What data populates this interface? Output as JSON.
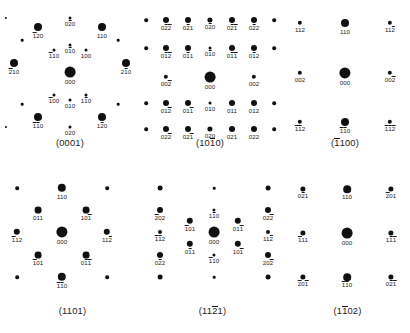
{
  "figure": {
    "title": "",
    "spot_color": "#111111",
    "background": "#ffffff",
    "panel_count": 6
  },
  "panels": [
    {
      "id": "panel-0001",
      "caption": "(0001)",
      "caption_plain": "0001",
      "box": {
        "x": 0,
        "y": 0,
        "w": 140,
        "h": 165
      },
      "spots": [
        {
          "x": 70,
          "y": 72,
          "r": 5.4,
          "label": "000",
          "bars": []
        },
        {
          "x": 38,
          "y": 27,
          "r": 4.0,
          "label": "120",
          "bars": [
            0
          ]
        },
        {
          "x": 102,
          "y": 27,
          "r": 4.0,
          "label": "110",
          "bars": []
        },
        {
          "x": 14,
          "y": 63,
          "r": 4.0,
          "label": "210",
          "bars": [
            0
          ]
        },
        {
          "x": 126,
          "y": 63,
          "r": 4.0,
          "label": "210",
          "bars": [
            1
          ]
        },
        {
          "x": 38,
          "y": 117,
          "r": 4.0,
          "label": "110",
          "bars": [
            0,
            1
          ]
        },
        {
          "x": 102,
          "y": 117,
          "r": 4.0,
          "label": "120",
          "bars": [
            1
          ]
        },
        {
          "x": 70,
          "y": 18,
          "r": 1.5,
          "label": "020",
          "bars": [
            1
          ]
        },
        {
          "x": 70,
          "y": 45,
          "r": 1.5,
          "label": "010",
          "bars": [
            1
          ]
        },
        {
          "x": 54,
          "y": 50,
          "r": 1.5,
          "label": "110",
          "bars": [
            0
          ]
        },
        {
          "x": 86,
          "y": 50,
          "r": 1.5,
          "label": "100",
          "bars": []
        },
        {
          "x": 54,
          "y": 95,
          "r": 1.5,
          "label": "100",
          "bars": [
            0
          ]
        },
        {
          "x": 86,
          "y": 95,
          "r": 1.5,
          "label": "110",
          "bars": [
            1
          ]
        },
        {
          "x": 70,
          "y": 100,
          "r": 1.5,
          "label": "010",
          "bars": []
        },
        {
          "x": 70,
          "y": 127,
          "r": 1.5,
          "label": "020",
          "bars": []
        },
        {
          "x": 22,
          "y": 40,
          "r": 1.3,
          "label": "",
          "bars": []
        },
        {
          "x": 118,
          "y": 40,
          "r": 1.3,
          "label": "",
          "bars": []
        },
        {
          "x": 22,
          "y": 104,
          "r": 1.3,
          "label": "",
          "bars": []
        },
        {
          "x": 118,
          "y": 104,
          "r": 1.3,
          "label": "",
          "bars": []
        },
        {
          "x": 6,
          "y": 18,
          "r": 1.1,
          "label": "",
          "bars": []
        },
        {
          "x": 6,
          "y": 127,
          "r": 1.1,
          "label": "",
          "bars": []
        }
      ]
    },
    {
      "id": "panel-1010",
      "caption": "(1010)",
      "caption_plain": "1010",
      "caption_bar_index": 2,
      "box": {
        "x": 140,
        "y": 0,
        "w": 140,
        "h": 165
      },
      "spots": [
        {
          "x": 70,
          "y": 77,
          "r": 5.4,
          "label": "000",
          "bars": []
        },
        {
          "x": 26,
          "y": 77,
          "r": 2.2,
          "label": "002",
          "bars": [
            2
          ]
        },
        {
          "x": 114,
          "y": 77,
          "r": 2.2,
          "label": "002",
          "bars": []
        },
        {
          "x": 26,
          "y": 48,
          "r": 3.0,
          "label": "012",
          "bars": [
            1,
            2
          ]
        },
        {
          "x": 48,
          "y": 48,
          "r": 3.0,
          "label": "011",
          "bars": [
            1
          ]
        },
        {
          "x": 70,
          "y": 48,
          "r": 1.5,
          "label": "010",
          "bars": [
            1
          ]
        },
        {
          "x": 92,
          "y": 48,
          "r": 3.0,
          "label": "011",
          "bars": [
            1,
            2
          ]
        },
        {
          "x": 114,
          "y": 48,
          "r": 3.0,
          "label": "012",
          "bars": [
            1
          ]
        },
        {
          "x": 6,
          "y": 48,
          "r": 1.8,
          "label": "",
          "bars": []
        },
        {
          "x": 134,
          "y": 48,
          "r": 1.8,
          "label": "",
          "bars": []
        },
        {
          "x": 26,
          "y": 20,
          "r": 3.0,
          "label": "022",
          "bars": [
            1,
            2
          ]
        },
        {
          "x": 48,
          "y": 20,
          "r": 3.0,
          "label": "021",
          "bars": [
            1
          ]
        },
        {
          "x": 70,
          "y": 20,
          "r": 2.6,
          "label": "020",
          "bars": [
            1
          ]
        },
        {
          "x": 92,
          "y": 20,
          "r": 3.0,
          "label": "021",
          "bars": [
            1,
            2
          ]
        },
        {
          "x": 114,
          "y": 20,
          "r": 3.0,
          "label": "022",
          "bars": [
            1
          ]
        },
        {
          "x": 6,
          "y": 20,
          "r": 1.8,
          "label": "",
          "bars": []
        },
        {
          "x": 134,
          "y": 20,
          "r": 1.8,
          "label": "",
          "bars": []
        },
        {
          "x": 26,
          "y": 103,
          "r": 3.0,
          "label": "012",
          "bars": [
            2
          ]
        },
        {
          "x": 48,
          "y": 103,
          "r": 3.0,
          "label": "011",
          "bars": [
            2
          ]
        },
        {
          "x": 70,
          "y": 103,
          "r": 1.5,
          "label": "010",
          "bars": []
        },
        {
          "x": 92,
          "y": 103,
          "r": 3.0,
          "label": "011",
          "bars": []
        },
        {
          "x": 114,
          "y": 103,
          "r": 3.0,
          "label": "012",
          "bars": []
        },
        {
          "x": 6,
          "y": 103,
          "r": 1.8,
          "label": "",
          "bars": []
        },
        {
          "x": 134,
          "y": 103,
          "r": 1.8,
          "label": "",
          "bars": []
        },
        {
          "x": 26,
          "y": 129,
          "r": 3.0,
          "label": "022",
          "bars": [
            2
          ]
        },
        {
          "x": 48,
          "y": 129,
          "r": 3.0,
          "label": "021",
          "bars": [
            2
          ]
        },
        {
          "x": 70,
          "y": 129,
          "r": 2.6,
          "label": "020",
          "bars": []
        },
        {
          "x": 92,
          "y": 129,
          "r": 3.0,
          "label": "021",
          "bars": []
        },
        {
          "x": 114,
          "y": 129,
          "r": 3.0,
          "label": "022",
          "bars": []
        },
        {
          "x": 6,
          "y": 129,
          "r": 1.8,
          "label": "",
          "bars": []
        },
        {
          "x": 134,
          "y": 129,
          "r": 1.8,
          "label": "",
          "bars": []
        }
      ]
    },
    {
      "id": "panel-1100",
      "caption": "(1100)",
      "caption_plain": "1100",
      "caption_bar_index": 0,
      "box": {
        "x": 280,
        "y": 0,
        "w": 130,
        "h": 165
      },
      "spots": [
        {
          "x": 65,
          "y": 73,
          "r": 5.6,
          "label": "000",
          "bars": []
        },
        {
          "x": 20,
          "y": 73,
          "r": 2.2,
          "label": "002",
          "bars": []
        },
        {
          "x": 110,
          "y": 73,
          "r": 2.2,
          "label": "002",
          "bars": [
            2
          ]
        },
        {
          "x": 65,
          "y": 23,
          "r": 4.0,
          "label": "110",
          "bars": []
        },
        {
          "x": 20,
          "y": 23,
          "r": 2.2,
          "label": "112",
          "bars": []
        },
        {
          "x": 110,
          "y": 23,
          "r": 2.2,
          "label": "112",
          "bars": [
            2
          ]
        },
        {
          "x": 65,
          "y": 122,
          "r": 4.0,
          "label": "110",
          "bars": [
            0,
            1
          ]
        },
        {
          "x": 20,
          "y": 122,
          "r": 2.2,
          "label": "112",
          "bars": [
            0,
            1
          ]
        },
        {
          "x": 110,
          "y": 122,
          "r": 2.2,
          "label": "112",
          "bars": [
            0,
            1,
            2
          ]
        }
      ]
    },
    {
      "id": "panel-1101",
      "caption": "(1101)",
      "caption_plain": "1101",
      "box": {
        "x": 0,
        "y": 165,
        "w": 145,
        "h": 168
      },
      "spots": [
        {
          "x": 62,
          "y": 67,
          "r": 5.6,
          "label": "000",
          "bars": []
        },
        {
          "x": 62,
          "y": 23,
          "r": 4.2,
          "label": "110",
          "bars": []
        },
        {
          "x": 62,
          "y": 112,
          "r": 4.2,
          "label": "110",
          "bars": [
            0,
            1
          ]
        },
        {
          "x": 38,
          "y": 45,
          "r": 3.4,
          "label": "011",
          "bars": []
        },
        {
          "x": 86,
          "y": 45,
          "r": 3.4,
          "label": "101",
          "bars": [
            2
          ]
        },
        {
          "x": 38,
          "y": 90,
          "r": 3.4,
          "label": "101",
          "bars": [
            0
          ]
        },
        {
          "x": 86,
          "y": 90,
          "r": 3.4,
          "label": "011",
          "bars": [
            1,
            2
          ]
        },
        {
          "x": 17,
          "y": 67,
          "r": 3.2,
          "label": "112",
          "bars": [
            0
          ]
        },
        {
          "x": 107,
          "y": 67,
          "r": 3.2,
          "label": "112",
          "bars": [
            2
          ]
        },
        {
          "x": 17,
          "y": 23,
          "r": 1.8,
          "label": "",
          "bars": []
        },
        {
          "x": 107,
          "y": 23,
          "r": 1.8,
          "label": "",
          "bars": []
        },
        {
          "x": 17,
          "y": 112,
          "r": 1.8,
          "label": "",
          "bars": []
        },
        {
          "x": 107,
          "y": 112,
          "r": 1.8,
          "label": "",
          "bars": []
        }
      ]
    },
    {
      "id": "panel-1121",
      "caption": "(1121)",
      "caption_plain": "1121",
      "caption_bar_index": 2,
      "box": {
        "x": 145,
        "y": 165,
        "w": 135,
        "h": 168
      },
      "spots": [
        {
          "x": 69,
          "y": 67,
          "r": 5.4,
          "label": "000",
          "bars": []
        },
        {
          "x": 69,
          "y": 45,
          "r": 1.6,
          "label": "110",
          "bars": [
            1
          ]
        },
        {
          "x": 69,
          "y": 90,
          "r": 1.6,
          "label": "110",
          "bars": [
            0
          ]
        },
        {
          "x": 45,
          "y": 56,
          "r": 3.2,
          "label": "101",
          "bars": [
            0
          ]
        },
        {
          "x": 93,
          "y": 56,
          "r": 3.2,
          "label": "011",
          "bars": [
            2
          ]
        },
        {
          "x": 45,
          "y": 79,
          "r": 3.2,
          "label": "011",
          "bars": [
            1
          ]
        },
        {
          "x": 93,
          "y": 79,
          "r": 3.2,
          "label": "101",
          "bars": [
            2
          ]
        },
        {
          "x": 15,
          "y": 45,
          "r": 3.0,
          "label": "202",
          "bars": [
            0
          ]
        },
        {
          "x": 123,
          "y": 45,
          "r": 3.0,
          "label": "022",
          "bars": [
            2
          ]
        },
        {
          "x": 15,
          "y": 67,
          "r": 2.0,
          "label": "112",
          "bars": [
            0,
            1
          ]
        },
        {
          "x": 123,
          "y": 67,
          "r": 2.0,
          "label": "112",
          "bars": [
            2
          ]
        },
        {
          "x": 15,
          "y": 90,
          "r": 3.0,
          "label": "022",
          "bars": [
            1
          ]
        },
        {
          "x": 123,
          "y": 90,
          "r": 3.0,
          "label": "202",
          "bars": [
            2
          ]
        },
        {
          "x": 15,
          "y": 23,
          "r": 2.4,
          "label": "",
          "bars": []
        },
        {
          "x": 123,
          "y": 23,
          "r": 2.4,
          "label": "",
          "bars": []
        },
        {
          "x": 15,
          "y": 112,
          "r": 2.4,
          "label": "",
          "bars": []
        },
        {
          "x": 123,
          "y": 112,
          "r": 2.4,
          "label": "",
          "bars": []
        },
        {
          "x": 69,
          "y": 23,
          "r": 1.3,
          "label": "",
          "bars": []
        },
        {
          "x": 69,
          "y": 112,
          "r": 1.3,
          "label": "",
          "bars": []
        }
      ]
    },
    {
      "id": "panel-1102",
      "caption": "(1102)",
      "caption_plain": "1102",
      "caption_bar_index": 1,
      "box": {
        "x": 285,
        "y": 165,
        "w": 125,
        "h": 168
      },
      "spots": [
        {
          "x": 62,
          "y": 68,
          "r": 5.4,
          "label": "000",
          "bars": []
        },
        {
          "x": 62,
          "y": 24,
          "r": 3.8,
          "label": "110",
          "bars": []
        },
        {
          "x": 62,
          "y": 112,
          "r": 3.8,
          "label": "110",
          "bars": [
            0,
            1
          ]
        },
        {
          "x": 18,
          "y": 24,
          "r": 2.6,
          "label": "021",
          "bars": [
            1
          ]
        },
        {
          "x": 106,
          "y": 24,
          "r": 2.6,
          "label": "201",
          "bars": [
            0
          ]
        },
        {
          "x": 18,
          "y": 68,
          "r": 2.6,
          "label": "111",
          "bars": [
            0
          ]
        },
        {
          "x": 106,
          "y": 68,
          "r": 2.6,
          "label": "111",
          "bars": [
            1,
            2
          ]
        },
        {
          "x": 18,
          "y": 112,
          "r": 2.6,
          "label": "201",
          "bars": [
            0,
            2
          ]
        },
        {
          "x": 106,
          "y": 112,
          "r": 2.6,
          "label": "021",
          "bars": [
            1,
            2
          ]
        }
      ]
    }
  ]
}
